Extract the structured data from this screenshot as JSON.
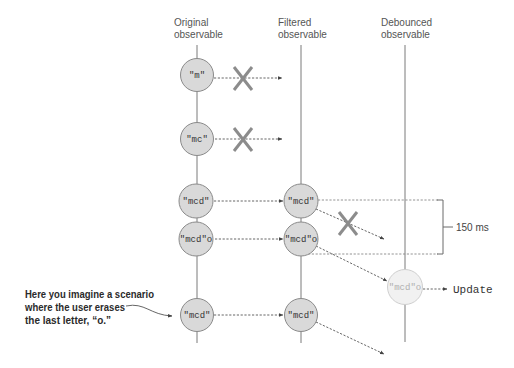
{
  "columns": [
    {
      "id": "original",
      "label_line1": "Original",
      "label_line2": "observable"
    },
    {
      "id": "filtered",
      "label_line1": "Filtered",
      "label_line2": "observable"
    },
    {
      "id": "debounced",
      "label_line1": "Debounced",
      "label_line2": "observable"
    }
  ],
  "original_events": [
    "\"m\"",
    "\"mc\"",
    "\"mcd\"",
    "\"mcd\"o",
    "\"mcd\""
  ],
  "filtered_events": [
    "\"mcd\"",
    "\"mcd\"o",
    "\"mcd\""
  ],
  "debounced_events": [
    "\"mcd\"o"
  ],
  "rejected_marker": "X",
  "debounce_interval": "150 ms",
  "output_label": "Update",
  "annotation": {
    "line1": "Here you imagine a scenario",
    "line2": "where the user erases",
    "line3": "the last letter, “o.”"
  },
  "colors": {
    "event_fill": "#d9d9d9",
    "event_faded_fill": "#f1f1f1",
    "timeline": "#7a7a7a",
    "reject_mark": "#8c8c8c"
  }
}
